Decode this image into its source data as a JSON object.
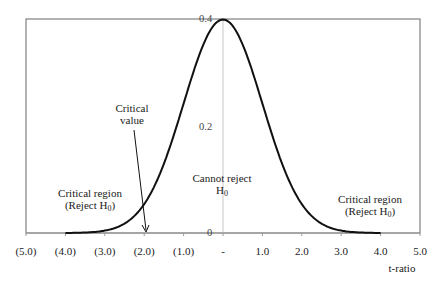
{
  "chart_data": {
    "type": "line",
    "title": "",
    "xlabel": "t-ratio",
    "ylabel": "",
    "xlim": [
      -5,
      5
    ],
    "ylim": [
      0,
      0.4
    ],
    "grid": false,
    "legend": null,
    "x_tick_labels": [
      "(5.0)",
      "(4.0)",
      "(3.0)",
      "(2.0)",
      "(1.0)",
      "-",
      "1.0",
      "2.0",
      "3.0",
      "4.0",
      "5.0"
    ],
    "x_ticks": [
      -5,
      -4,
      -3,
      -2,
      -1,
      0,
      1,
      2,
      3,
      4,
      5
    ],
    "y_tick_labels": [
      "0",
      "0.2",
      "0.4"
    ],
    "y_ticks": [
      0,
      0.2,
      0.4
    ],
    "series": [
      {
        "name": "t density",
        "x": [
          -4.0,
          -3.5,
          -3.0,
          -2.5,
          -2.0,
          -1.5,
          -1.0,
          -0.5,
          0.0,
          0.5,
          1.0,
          1.5,
          2.0,
          2.5,
          3.0,
          3.5,
          4.0
        ],
        "values": [
          0.0001,
          0.0009,
          0.0044,
          0.0175,
          0.054,
          0.1295,
          0.242,
          0.3521,
          0.3989,
          0.3521,
          0.242,
          0.1295,
          0.054,
          0.0175,
          0.0044,
          0.0009,
          0.0001
        ]
      }
    ],
    "annotations": [
      {
        "text": "Critical value",
        "lines": [
          "Critical",
          "value"
        ],
        "arrow_to_x": -2.0,
        "arrow_to_y": 0
      },
      {
        "text": "Critical region (Reject H0)",
        "lines": [
          "Critical region",
          "(Reject H",
          "0",
          ")"
        ],
        "x": -3.6,
        "side": "left"
      },
      {
        "text": "Cannot reject H0",
        "lines": [
          "Cannot reject",
          "H",
          "0"
        ],
        "x": 0
      },
      {
        "text": "Critical region (Reject H0)",
        "lines": [
          "Critical region",
          "(Reject H",
          "0",
          ")"
        ],
        "x": 3.7,
        "side": "right"
      }
    ]
  },
  "labels": {
    "critical_value_line1": "Critical",
    "critical_value_line2": "value",
    "left_region_line1": "Critical region",
    "left_region_line2": "(Reject H",
    "left_region_sub": "0",
    "left_region_close": ")",
    "center_line1": "Cannot reject",
    "center_line2": "H",
    "center_sub": "0",
    "right_region_line1": "Critical region",
    "right_region_line2": "(Reject H",
    "right_region_sub": "0",
    "right_region_close": ")",
    "xlabel": "t-ratio",
    "y0": "0",
    "y02": "0.2",
    "y04": "0.4"
  },
  "colors": {
    "curve": "#111111",
    "frame": "#555555",
    "axis": "#bbbbbb"
  }
}
